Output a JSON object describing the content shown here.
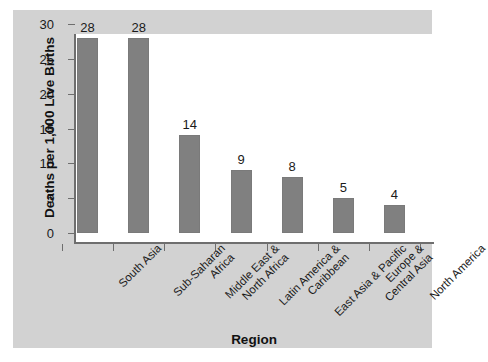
{
  "chart_data": {
    "type": "bar",
    "title": "",
    "xlabel": "Region",
    "ylabel": "Deaths per 1,000 Live Births",
    "categories": [
      "South Asia",
      "Sub-Saharan Africa",
      "Middle East & North Africa",
      "Latin America & Caribbean",
      "East Asia & Pacific",
      "Europe & Central Asia",
      "North America"
    ],
    "category_lines": [
      [
        "South Asia"
      ],
      [
        "Sub-Saharan",
        "Africa"
      ],
      [
        "Middle East &",
        "North Africa"
      ],
      [
        "Latin America &",
        "Caribbean"
      ],
      [
        "East Asia & Pacific"
      ],
      [
        "Europe &",
        "Central Asia"
      ],
      [
        "North America"
      ]
    ],
    "values": [
      28,
      28,
      14,
      9,
      8,
      5,
      4
    ],
    "data_labels": [
      "28",
      "28",
      "14",
      "9",
      "8",
      "5",
      "4"
    ],
    "ylim": [
      0,
      30
    ],
    "yticks": [
      0,
      5,
      10,
      15,
      20,
      25,
      30
    ],
    "ytick_labels": [
      "0",
      "5",
      "10",
      "15",
      "20",
      "25",
      "30"
    ],
    "grid": false,
    "legend": false,
    "bar_color": "#808080",
    "plot_background": "#ffffff",
    "panel_background": "#d2d2d2",
    "axis_color": "#6e6e6e",
    "text_color": "#1a1a1a"
  }
}
